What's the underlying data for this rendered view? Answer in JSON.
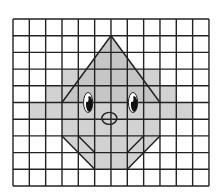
{
  "figure": {
    "grid": {
      "columns": 12,
      "rows": 10,
      "origin_x": 13,
      "origin_y": 19,
      "cell_width": 16.33,
      "cell_height": 16.7,
      "line_color": "#222222",
      "line_width": 1.4,
      "background": "#ffffff"
    },
    "shaded_region": {
      "fill": "#d2d2d2",
      "points": [
        [
          6,
          1
        ],
        [
          4.5,
          3
        ],
        [
          3,
          3
        ],
        [
          3,
          4
        ],
        [
          2,
          4
        ],
        [
          2,
          5
        ],
        [
          1,
          5
        ],
        [
          1,
          6
        ],
        [
          3,
          6
        ],
        [
          3,
          7
        ],
        [
          5,
          9
        ],
        [
          7,
          9
        ],
        [
          9,
          7
        ],
        [
          9,
          6
        ],
        [
          11,
          6
        ],
        [
          11,
          5
        ],
        [
          10,
          5
        ],
        [
          10,
          4
        ],
        [
          9,
          4
        ],
        [
          9,
          3
        ],
        [
          7.5,
          3
        ]
      ]
    },
    "top_triangle": {
      "fill": "#c6c6c6",
      "points": [
        [
          6,
          1
        ],
        [
          3,
          5
        ],
        [
          9,
          5
        ]
      ]
    },
    "outline_segments": [
      [
        [
          6,
          1
        ],
        [
          3,
          5
        ]
      ],
      [
        [
          6,
          1
        ],
        [
          9,
          5
        ]
      ],
      [
        [
          3,
          7
        ],
        [
          5,
          9
        ]
      ],
      [
        [
          9,
          7
        ],
        [
          7,
          9
        ]
      ],
      [
        [
          4,
          7
        ],
        [
          5,
          8
        ]
      ],
      [
        [
          8,
          7
        ],
        [
          7,
          8
        ]
      ]
    ],
    "eyes": [
      {
        "name": "left-eye",
        "cx": 4.6,
        "cy": 5.0,
        "rx": 0.28,
        "ry": 0.6
      },
      {
        "name": "right-eye",
        "cx": 7.35,
        "cy": 5.0,
        "rx": 0.28,
        "ry": 0.6
      }
    ],
    "nose": {
      "cx": 5.9,
      "cy": 5.95,
      "rx": 0.46,
      "ry": 0.36
    },
    "colors": {
      "outline": "#222222",
      "pupil": "#111111",
      "eye_white": "#ffffff"
    }
  }
}
